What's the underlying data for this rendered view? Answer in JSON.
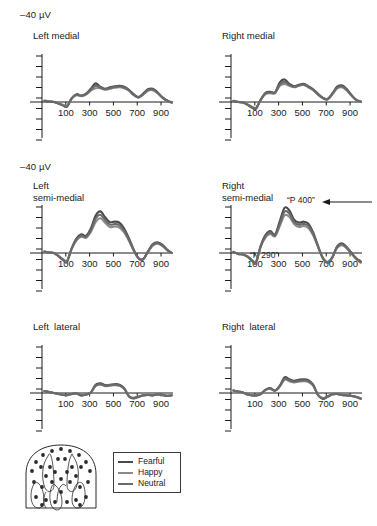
{
  "figure": {
    "type": "erp-waveform-grid",
    "scale_label_top": "–40 µV",
    "scale_label_mid": "–40 µV",
    "background": "#ffffff",
    "axis_color": "#1a1a1a"
  },
  "legend": {
    "entries": [
      {
        "label": "Fearful",
        "color": "#4a4a4a"
      },
      {
        "label": "Happy",
        "color": "#8a8a8a"
      },
      {
        "label": "Neutral",
        "color": "#6a6a6a"
      }
    ]
  },
  "head_diagram": {
    "name": "infant-head-electrode-schematic",
    "electrode_count": 31
  },
  "annotations": [
    {
      "id": "p400",
      "text": "“P 400”",
      "panel": "right-semi-medial"
    },
    {
      "id": "n290",
      "text": "“N 290”",
      "panel": "right-semi-medial"
    }
  ],
  "chart_data": {
    "type": "line",
    "title": "",
    "xlabel": "",
    "ylabel": "–40 µV",
    "xlim": [
      -100,
      1000
    ],
    "ylim": [
      -40,
      40
    ],
    "grid": false,
    "legend_position": "bottom-center",
    "xticks": [
      100,
      300,
      500,
      700,
      900
    ],
    "xticklabels": [
      "100",
      "300",
      "500",
      "700",
      "900"
    ],
    "series_names": [
      "Fearful",
      "Happy",
      "Neutral"
    ],
    "series_colors": [
      "#4a4a4a",
      "#8a8a8a",
      "#6a6a6a"
    ],
    "x": [
      -80,
      -40,
      0,
      40,
      80,
      110,
      150,
      190,
      230,
      270,
      310,
      350,
      390,
      430,
      470,
      510,
      550,
      590,
      630,
      670,
      710,
      750,
      790,
      830,
      870,
      910,
      950,
      990
    ],
    "panels": [
      {
        "id": "left-medial",
        "title": "Left medial",
        "row": 0,
        "col": 0,
        "series": [
          {
            "name": "Fearful",
            "values": [
              0.5,
              0.2,
              0.0,
              -0.6,
              -1.4,
              -1.8,
              1.6,
              3.2,
              2.6,
              3.4,
              5.4,
              7.6,
              6.2,
              5.4,
              6.0,
              6.4,
              6.6,
              6.2,
              5.0,
              3.2,
              2.0,
              3.4,
              5.2,
              5.4,
              4.0,
              2.0,
              0.6,
              -0.2
            ]
          },
          {
            "name": "Happy",
            "values": [
              0.6,
              0.3,
              0.0,
              -0.5,
              -1.2,
              -1.6,
              1.4,
              2.8,
              2.4,
              3.0,
              4.6,
              5.6,
              5.6,
              5.0,
              5.4,
              5.8,
              6.0,
              5.6,
              4.6,
              2.8,
              1.8,
              3.0,
              4.6,
              4.8,
              3.6,
              1.8,
              0.5,
              -0.3
            ]
          },
          {
            "name": "Neutral",
            "values": [
              0.4,
              0.2,
              0.0,
              -0.7,
              -1.5,
              -1.9,
              1.5,
              3.0,
              2.5,
              3.2,
              5.0,
              6.6,
              5.9,
              5.2,
              5.7,
              6.1,
              6.3,
              5.9,
              4.8,
              3.0,
              1.9,
              3.2,
              4.9,
              5.1,
              3.8,
              1.9,
              0.6,
              -0.2
            ]
          }
        ]
      },
      {
        "id": "right-medial",
        "title": "Right medial",
        "row": 0,
        "col": 1,
        "series": [
          {
            "name": "Fearful",
            "values": [
              0.4,
              0.0,
              -0.2,
              -1.2,
              -2.4,
              -2.8,
              1.0,
              3.8,
              4.2,
              4.0,
              8.0,
              9.2,
              7.4,
              6.4,
              7.0,
              7.4,
              6.4,
              5.2,
              3.4,
              1.8,
              1.2,
              3.4,
              6.2,
              6.8,
              5.4,
              3.0,
              1.0,
              0.2
            ]
          },
          {
            "name": "Happy",
            "values": [
              0.5,
              0.1,
              -0.2,
              -1.0,
              -2.0,
              -2.4,
              0.9,
              3.2,
              3.6,
              3.6,
              6.6,
              7.4,
              6.6,
              6.0,
              6.6,
              7.0,
              6.0,
              4.8,
              3.0,
              1.6,
              1.0,
              3.0,
              5.4,
              6.0,
              4.8,
              2.6,
              0.9,
              0.1
            ]
          },
          {
            "name": "Neutral",
            "values": [
              0.4,
              0.0,
              -0.2,
              -1.1,
              -2.2,
              -2.6,
              0.9,
              3.5,
              3.9,
              3.8,
              7.2,
              8.2,
              7.0,
              6.2,
              6.8,
              7.2,
              6.2,
              5.0,
              3.2,
              1.7,
              1.1,
              3.2,
              5.8,
              6.4,
              5.1,
              2.8,
              0.9,
              0.1
            ]
          }
        ]
      },
      {
        "id": "left-semi-medial",
        "title": "Left\nsemi-medial",
        "row": 1,
        "col": 0,
        "series": [
          {
            "name": "Fearful",
            "values": [
              0.6,
              0.2,
              0.0,
              -1.4,
              -3.0,
              -3.6,
              2.0,
              6.0,
              7.6,
              7.0,
              10.0,
              15.2,
              17.0,
              14.6,
              12.6,
              12.8,
              12.4,
              10.0,
              6.0,
              1.4,
              -2.2,
              -2.6,
              0.6,
              3.6,
              4.4,
              3.4,
              1.4,
              0.0
            ]
          },
          {
            "name": "Happy",
            "values": [
              0.6,
              0.2,
              0.0,
              -1.2,
              -2.6,
              -3.2,
              1.8,
              5.2,
              6.6,
              6.2,
              8.6,
              12.6,
              14.2,
              12.4,
              10.6,
              10.8,
              10.4,
              8.4,
              5.0,
              1.0,
              -2.0,
              -2.4,
              0.4,
              3.0,
              3.8,
              2.9,
              1.2,
              0.0
            ]
          },
          {
            "name": "Neutral",
            "values": [
              0.6,
              0.2,
              0.0,
              -1.3,
              -2.8,
              -3.4,
              1.9,
              5.6,
              7.1,
              6.6,
              9.3,
              14.0,
              15.6,
              13.5,
              11.6,
              11.8,
              11.4,
              9.2,
              5.5,
              1.2,
              -2.1,
              -2.5,
              0.5,
              3.3,
              4.1,
              3.1,
              1.3,
              0.0
            ]
          }
        ]
      },
      {
        "id": "right-semi-medial",
        "title": "Right\nsemi-medial",
        "row": 1,
        "col": 1,
        "series": [
          {
            "name": "Fearful",
            "values": [
              0.4,
              -0.4,
              -0.6,
              -1.6,
              -3.4,
              -4.0,
              3.0,
              7.4,
              9.0,
              7.6,
              13.0,
              18.4,
              17.4,
              13.6,
              12.4,
              12.8,
              12.0,
              8.4,
              3.0,
              -2.0,
              -4.0,
              -2.0,
              2.6,
              4.0,
              2.6,
              0.2,
              -2.0,
              -3.4
            ]
          },
          {
            "name": "Happy",
            "values": [
              0.5,
              -0.3,
              -0.5,
              -1.4,
              -3.0,
              -3.6,
              2.6,
              6.4,
              7.8,
              6.8,
              11.0,
              15.4,
              14.8,
              11.8,
              10.6,
              11.0,
              10.2,
              7.2,
              2.6,
              -1.8,
              -3.6,
              -1.8,
              2.0,
              3.2,
              2.0,
              -0.2,
              -2.4,
              -4.0
            ]
          },
          {
            "name": "Neutral",
            "values": [
              0.4,
              -0.4,
              -0.6,
              -1.5,
              -3.2,
              -3.8,
              2.8,
              6.9,
              8.4,
              7.2,
              12.0,
              16.9,
              16.1,
              12.7,
              11.5,
              11.9,
              11.1,
              7.8,
              2.8,
              -1.9,
              -3.8,
              -1.9,
              2.3,
              3.6,
              2.3,
              0.0,
              -2.2,
              -3.7
            ]
          }
        ]
      },
      {
        "id": "left-lateral",
        "title": "Left  lateral",
        "row": 2,
        "col": 0,
        "series": [
          {
            "name": "Fearful",
            "values": [
              0.8,
              0.4,
              0.0,
              -0.4,
              -0.8,
              -0.9,
              -0.4,
              -0.2,
              -1.0,
              -0.6,
              0.2,
              3.4,
              4.0,
              3.2,
              3.4,
              3.6,
              3.4,
              2.0,
              -1.4,
              -2.2,
              -1.6,
              -1.0,
              -0.8,
              -1.0,
              -0.6,
              -0.8,
              -1.2,
              -1.0
            ]
          },
          {
            "name": "Happy",
            "values": [
              0.8,
              0.4,
              0.0,
              -0.4,
              -0.8,
              -0.9,
              -0.4,
              -0.2,
              -0.9,
              -0.6,
              0.2,
              2.8,
              3.4,
              2.8,
              3.0,
              3.2,
              3.0,
              1.8,
              -1.2,
              -2.0,
              -1.4,
              -0.9,
              -0.7,
              -0.9,
              -0.5,
              -0.7,
              -1.1,
              -0.9
            ]
          },
          {
            "name": "Neutral",
            "values": [
              0.8,
              0.4,
              0.0,
              -0.4,
              -0.8,
              -0.9,
              -0.4,
              -0.2,
              -1.0,
              -0.6,
              0.2,
              3.1,
              3.7,
              3.0,
              3.2,
              3.4,
              3.2,
              1.9,
              -1.3,
              -2.1,
              -1.5,
              -0.95,
              -0.75,
              -0.95,
              -0.55,
              -0.75,
              -1.15,
              -0.95
            ]
          }
        ]
      },
      {
        "id": "right-lateral",
        "title": "Right  lateral",
        "row": 2,
        "col": 1,
        "series": [
          {
            "name": "Fearful",
            "values": [
              1.0,
              0.6,
              0.2,
              -0.6,
              -1.0,
              -1.0,
              -0.4,
              1.4,
              2.0,
              1.0,
              3.0,
              6.4,
              5.6,
              5.0,
              5.4,
              5.6,
              5.2,
              3.4,
              -0.8,
              -2.4,
              -1.6,
              -0.6,
              -0.4,
              -0.8,
              -1.0,
              -1.2,
              -1.6,
              -2.4
            ]
          },
          {
            "name": "Happy",
            "values": [
              1.0,
              0.6,
              0.2,
              -0.6,
              -1.0,
              -1.0,
              -0.4,
              1.2,
              1.7,
              0.9,
              2.6,
              5.4,
              4.8,
              4.3,
              4.6,
              4.8,
              4.5,
              3.0,
              -0.7,
              -2.1,
              -1.4,
              -0.5,
              -0.3,
              -0.7,
              -0.9,
              -1.1,
              -1.5,
              -2.1
            ]
          },
          {
            "name": "Neutral",
            "values": [
              1.0,
              0.6,
              0.2,
              -0.6,
              -1.0,
              -1.0,
              -0.4,
              1.3,
              1.85,
              0.95,
              2.8,
              5.9,
              5.2,
              4.65,
              5.0,
              5.2,
              4.85,
              3.2,
              -0.75,
              -2.25,
              -1.5,
              -0.55,
              -0.35,
              -0.75,
              -0.95,
              -1.15,
              -1.55,
              -2.25
            ]
          }
        ]
      }
    ]
  }
}
